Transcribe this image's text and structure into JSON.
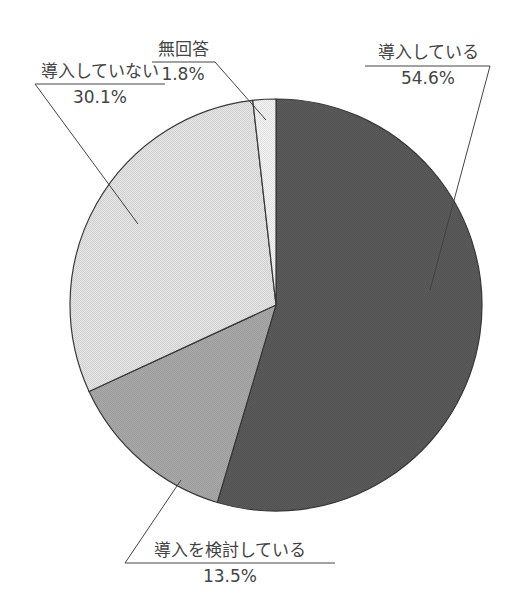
{
  "chart_data": {
    "type": "pie",
    "title": "",
    "start_angle": "12 o'clock",
    "direction": "clockwise",
    "slices": [
      {
        "label": "導入している",
        "value": 54.6,
        "value_label": "54.6%",
        "color": "#5a5a5a"
      },
      {
        "label": "導入を検討している",
        "value": 13.5,
        "value_label": "13.5%",
        "color": "#a9a9a9"
      },
      {
        "label": "導入していない",
        "value": 30.1,
        "value_label": "30.1%",
        "color": "#e4e4e4"
      },
      {
        "label": "無回答",
        "value": 1.8,
        "value_label": "1.8%",
        "color": "#f3f3f3"
      }
    ],
    "legend": "none (callout labels with leader lines)"
  }
}
